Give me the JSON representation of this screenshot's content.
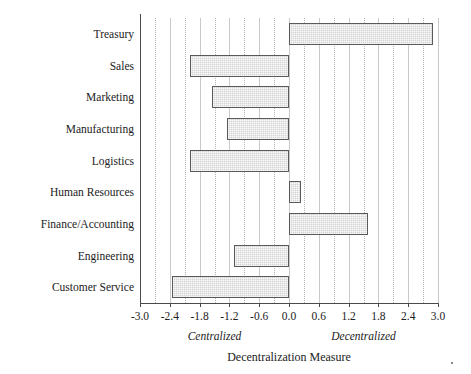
{
  "chart_data": {
    "type": "bar",
    "orientation": "horizontal",
    "title": "",
    "xlabel": "Decentralization Measure",
    "ylabel": "",
    "xlim": [
      -3.0,
      3.0
    ],
    "xticks": [
      "-3.0",
      "-2.4",
      "-1.8",
      "-1.2",
      "-0.6",
      "0.0",
      "0.6",
      "1.2",
      "1.8",
      "2.4",
      "3.0"
    ],
    "xtick_values": [
      -3.0,
      -2.4,
      -1.8,
      -1.2,
      -0.6,
      0.0,
      0.6,
      1.2,
      1.8,
      2.4,
      3.0
    ],
    "grid": true,
    "legend": "none",
    "categories": [
      "Treasury",
      "Sales",
      "Marketing",
      "Manufacturing",
      "Logistics",
      "Human Resources",
      "Finance/Accounting",
      "Engineering",
      "Customer Service"
    ],
    "values": [
      2.9,
      -2.0,
      -1.55,
      -1.25,
      -2.0,
      0.25,
      1.6,
      -1.1,
      -2.35
    ],
    "annotations": [
      {
        "text": "Centralized",
        "x": -1.5,
        "style": "italic"
      },
      {
        "text": "Decentralized",
        "x": 1.5,
        "style": "italic"
      }
    ],
    "colors": {
      "bar_fill": "#d4d4d4",
      "bar_border": "#5a5a5a",
      "gridline": "#c9c9c9",
      "axis": "#4a4a4a",
      "text": "#222222",
      "background": "#ffffff"
    }
  }
}
